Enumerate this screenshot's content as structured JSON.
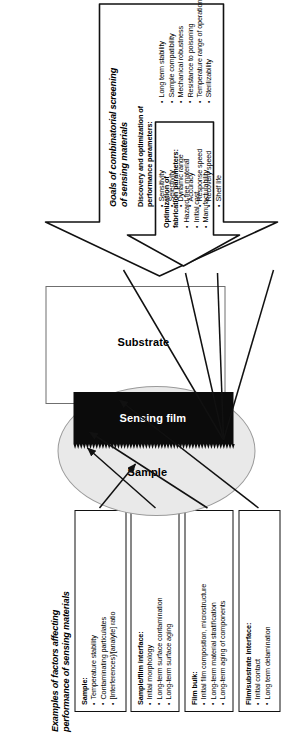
{
  "figure": {
    "top_heading": "Examples of factors affecting\nperformance of sensing materials",
    "bottom_heading": "Goals of combinatorial screening\nof sensing materials"
  },
  "schematic": {
    "sample_label": "Sample",
    "film_label": "Sensing film",
    "substrate_label": "Substrate",
    "colors": {
      "sample_fill": "#e9e9e9",
      "sample_stroke": "#9a9a9a",
      "film_fill": "#0b0b0b",
      "substrate_fill": "#ffffff",
      "substrate_stroke": "#6f6f6f",
      "connector_stroke": "#111111"
    }
  },
  "factor_boxes": [
    {
      "title": "Sample:",
      "items": [
        "Temperature stability",
        "Contaminating particulates",
        "[Interferences]/[analyte] ratio"
      ]
    },
    {
      "title": "Sample/film interface:",
      "items": [
        "Initial morphology",
        "Long-term surface contamination",
        "Long-term surface aging"
      ]
    },
    {
      "title": "Film bulk:",
      "items": [
        "Initial film composition, microstructure",
        "Long-term material stratification",
        "Long-term aging of components"
      ]
    },
    {
      "title": "Film/substrate interface:",
      "items": [
        "Initial contact",
        "Long term delamination"
      ]
    }
  ],
  "goal_boxes": [
    {
      "title": "Discovery and optimization of\nperformance parameters:",
      "items": [
        "Sensitivity",
        "Selectivity",
        "Dynamic range",
        "Accuracy",
        "Response speed",
        "Recovery speed",
        "Shelf life",
        "Long term stability",
        "Sample compatibility",
        "Mechanical robustness",
        "Resistance to poisoning",
        "Temperature range of operation",
        "Sterilizability"
      ]
    },
    {
      "title": "Optimization of\nfabrication parameters:",
      "items": [
        "Hazard-free material",
        "Initial cost",
        "Manufacturability"
      ]
    }
  ]
}
